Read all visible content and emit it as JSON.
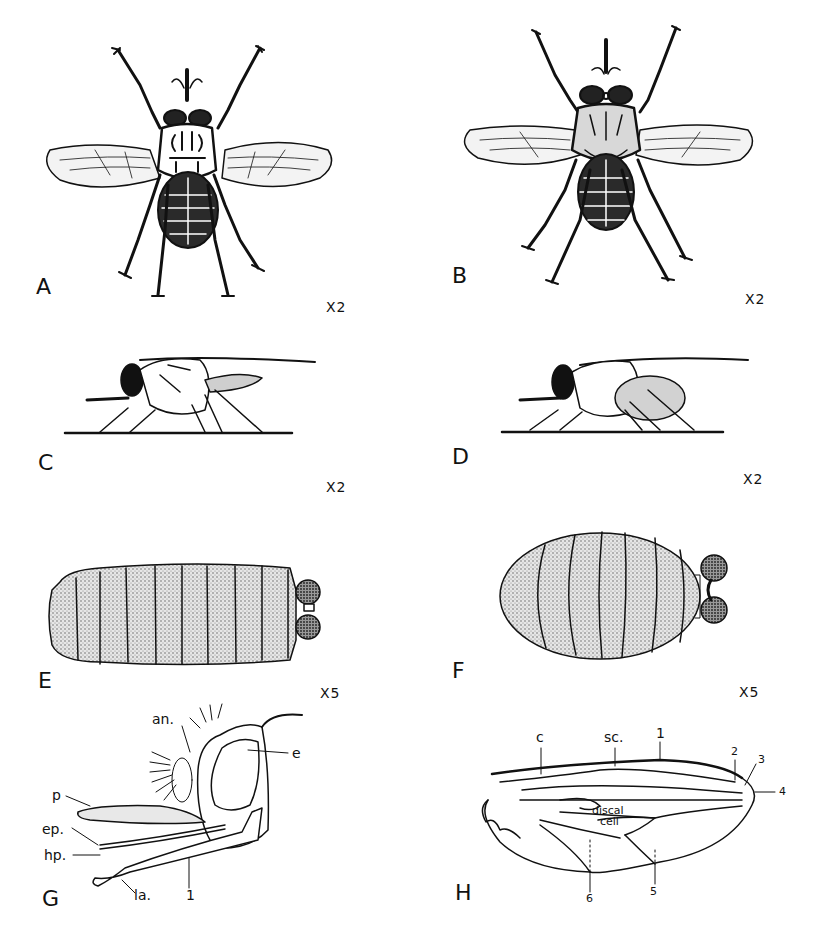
{
  "plate": {
    "background": "#ffffff",
    "ink": "#111111"
  },
  "panels": {
    "A": {
      "letter": "A",
      "scale": "X2",
      "subject": "adult fly, dorsal view"
    },
    "B": {
      "letter": "B",
      "scale": "X2",
      "subject": "adult fly, dorsal view"
    },
    "C": {
      "letter": "C",
      "scale": "X2",
      "subject": "adult fly, lateral view"
    },
    "D": {
      "letter": "D",
      "scale": "X2",
      "subject": "adult fly, lateral view"
    },
    "E": {
      "letter": "E",
      "scale": "X5",
      "subject": "puparium, elongate"
    },
    "F": {
      "letter": "F",
      "scale": "X5",
      "subject": "puparium, ovoid"
    },
    "G": {
      "letter": "G",
      "subject": "head, lateral view",
      "labels": {
        "an": "an.",
        "e": "e",
        "p": "p",
        "ep": "ep.",
        "hp": "hp.",
        "la": "la.",
        "one": "1"
      }
    },
    "H": {
      "letter": "H",
      "subject": "wing venation",
      "labels": {
        "c": "c",
        "sc": "sc.",
        "v1": "1",
        "v2": "2",
        "v3": "3",
        "v4": "4",
        "v5": "5",
        "v6": "6",
        "discal": "discal",
        "cell": "cell"
      }
    }
  }
}
